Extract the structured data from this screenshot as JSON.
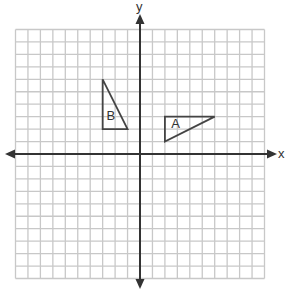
{
  "diagram": {
    "type": "coordinate-plane",
    "grid": {
      "x_min": -10,
      "x_max": 10,
      "y_min": -10,
      "y_max": 10,
      "step": 1
    },
    "axes": {
      "x_label": "x",
      "y_label": "y"
    },
    "colors": {
      "grid": "#c8c8c8",
      "axis": "#333333",
      "shape": "#444444",
      "background": "#ffffff"
    },
    "shapes": [
      {
        "label": "A",
        "type": "triangle",
        "vertices": [
          [
            2,
            3
          ],
          [
            6,
            3
          ],
          [
            2,
            1
          ]
        ],
        "label_pos": [
          2.5,
          2.1
        ]
      },
      {
        "label": "B",
        "type": "triangle",
        "vertices": [
          [
            -3,
            6
          ],
          [
            -3,
            2
          ],
          [
            -1,
            2
          ]
        ],
        "label_pos": [
          -2.7,
          2.7
        ]
      }
    ]
  }
}
